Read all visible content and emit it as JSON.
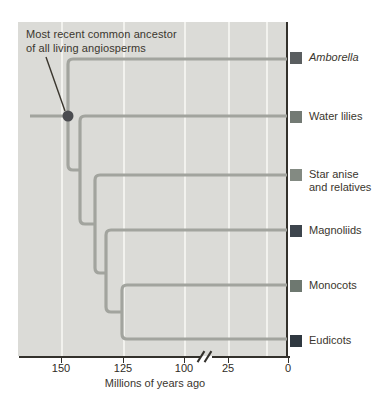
{
  "figure": {
    "annotation": {
      "line1": "Most recent common ancestor",
      "line2": "of all living angiosperms"
    },
    "taxa": [
      {
        "label": "Amborella",
        "italic": true,
        "swatch_color": "#5a5e60"
      },
      {
        "label": "Water lilies",
        "italic": false,
        "swatch_color": "#737a74"
      },
      {
        "label": "Star anise",
        "label2": "and relatives",
        "italic": false,
        "swatch_color": "#838a82"
      },
      {
        "label": "Magnoliids",
        "italic": false,
        "swatch_color": "#3d454d"
      },
      {
        "label": "Monocots",
        "italic": false,
        "swatch_color": "#6e7870"
      },
      {
        "label": "Eudicots",
        "italic": false,
        "swatch_color": "#2f3840"
      }
    ],
    "axis": {
      "tick_labels": [
        "150",
        "125",
        "100",
        "25",
        "0"
      ],
      "break_symbol": "//",
      "title": "Millions of years ago"
    },
    "colors": {
      "panel_bg": "#dbdbd7",
      "gridline": "#f2f2ee",
      "branch": "#a2a49e",
      "mrca_dot": "#4b4c50",
      "axis_dark": "#33312c",
      "text": "#3a362e"
    }
  },
  "tree_data": {
    "type": "cladogram",
    "time_axis": "millions of years ago, 150 (left) to 0 (right), axis break between 100 and 25",
    "root_label": "Most recent common ancestor of all living angiosperms",
    "root_time_mya_approx": 147,
    "tips_top_to_bottom": [
      "Amborella",
      "Water lilies",
      "Star anise and relatives",
      "Magnoliids",
      "Monocots",
      "Eudicots"
    ],
    "branching_order": [
      "Amborella diverges first at the MRCA dot",
      "then Water lilies",
      "then Star anise and relatives",
      "then Magnoliids",
      "Monocots and Eudicots are the final sister pair splitting near 125 Mya"
    ]
  }
}
